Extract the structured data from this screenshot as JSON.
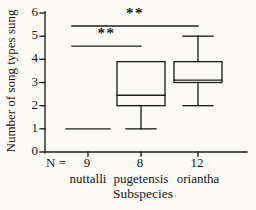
{
  "figure_title": "Box plot of song repertoire size by subspecies",
  "chart_data": {
    "type": "boxplot",
    "title": "",
    "xlabel": "Subspecies",
    "ylabel": "Number of song types sung",
    "ylim": [
      0,
      6
    ],
    "yticks": [
      0,
      1,
      2,
      3,
      4,
      5,
      6
    ],
    "grid": false,
    "legend": null,
    "n_label": "N =",
    "categories": [
      "nuttalli",
      "pugetensis",
      "oriantha"
    ],
    "sample_sizes": [
      9,
      8,
      12
    ],
    "boxes": [
      {
        "category": "nuttalli",
        "n": 9,
        "min": 1,
        "q1": 1,
        "median": 1,
        "q3": 1,
        "max": 1
      },
      {
        "category": "pugetensis",
        "n": 8,
        "min": 1,
        "q1": 2,
        "median": 2.45,
        "q3": 3.9,
        "max": 3.9
      },
      {
        "category": "oriantha",
        "n": 12,
        "min": 2,
        "q1": 3,
        "median": 3.1,
        "q3": 3.9,
        "max": 5
      }
    ],
    "significance": [
      {
        "from": "nuttalli",
        "to": "oriantha",
        "label": "**",
        "y": 5.44
      },
      {
        "from": "nuttalli",
        "to": "pugetensis",
        "label": "**",
        "y": 4.57
      }
    ],
    "colors": {
      "line": "#1f1f1f",
      "background": "#fcfbf8",
      "text": "#1a1a1a"
    }
  }
}
